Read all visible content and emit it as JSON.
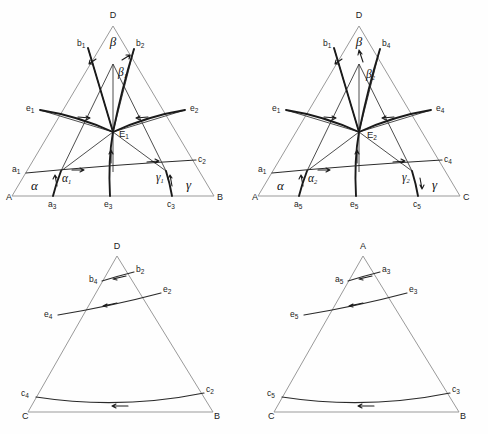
{
  "figure": {
    "title": "",
    "background": "#fefefe",
    "edge_color": "#9a9a9a",
    "curve_color": "#1a1a1a",
    "line_color": "#3a3a3a",
    "panels": [
      {
        "id": "top-left",
        "vertices": {
          "apex": "D",
          "left": "A",
          "right": "B"
        },
        "invariant_point": "E",
        "invariant_point_sub": "1",
        "greek": {
          "alpha": "α",
          "beta": "β",
          "gamma": "γ",
          "alpha_sub": "α",
          "alpha_sub_n": "1",
          "beta_sub": "β",
          "beta_sub_n": "1",
          "gamma_sub": "γ",
          "gamma_sub_n": "1"
        },
        "edge_labels": [
          {
            "name": "b1",
            "base": "b",
            "sub": "1"
          },
          {
            "name": "b2",
            "base": "b",
            "sub": "2"
          },
          {
            "name": "e1",
            "base": "e",
            "sub": "1"
          },
          {
            "name": "e2",
            "base": "e",
            "sub": "2"
          },
          {
            "name": "a1",
            "base": "a",
            "sub": "1"
          },
          {
            "name": "c2",
            "base": "c",
            "sub": "2"
          },
          {
            "name": "a3",
            "base": "a",
            "sub": "3"
          },
          {
            "name": "e3",
            "base": "e",
            "sub": "3"
          },
          {
            "name": "c3",
            "base": "c",
            "sub": "3"
          }
        ]
      },
      {
        "id": "top-right",
        "vertices": {
          "apex": "D",
          "left": "A",
          "right": "C"
        },
        "invariant_point": "E",
        "invariant_point_sub": "2",
        "greek": {
          "alpha": "α",
          "beta": "β",
          "gamma": "γ",
          "alpha_sub": "α",
          "alpha_sub_n": "2",
          "beta_sub": "β",
          "beta_sub_n": "2",
          "gamma_sub": "γ",
          "gamma_sub_n": "2"
        },
        "edge_labels": [
          {
            "name": "b1",
            "base": "b",
            "sub": "1"
          },
          {
            "name": "b4",
            "base": "b",
            "sub": "4"
          },
          {
            "name": "e1",
            "base": "e",
            "sub": "1"
          },
          {
            "name": "e4",
            "base": "e",
            "sub": "4"
          },
          {
            "name": "a1",
            "base": "a",
            "sub": "1"
          },
          {
            "name": "c4",
            "base": "c",
            "sub": "4"
          },
          {
            "name": "a5",
            "base": "a",
            "sub": "5"
          },
          {
            "name": "e5",
            "base": "e",
            "sub": "5"
          },
          {
            "name": "c5",
            "base": "c",
            "sub": "5"
          }
        ]
      },
      {
        "id": "bottom-left",
        "vertices": {
          "apex": "D",
          "left": "C",
          "right": "B"
        },
        "edge_labels": [
          {
            "name": "b4",
            "base": "b",
            "sub": "4"
          },
          {
            "name": "b2",
            "base": "b",
            "sub": "2"
          },
          {
            "name": "e4",
            "base": "e",
            "sub": "4"
          },
          {
            "name": "e2",
            "base": "e",
            "sub": "2"
          },
          {
            "name": "c4",
            "base": "c",
            "sub": "4"
          },
          {
            "name": "c2",
            "base": "c",
            "sub": "2"
          }
        ]
      },
      {
        "id": "bottom-right",
        "vertices": {
          "apex": "A",
          "left": "C",
          "right": "B"
        },
        "edge_labels": [
          {
            "name": "a5",
            "base": "a",
            "sub": "5"
          },
          {
            "name": "a3",
            "base": "a",
            "sub": "3"
          },
          {
            "name": "e5",
            "base": "e",
            "sub": "5"
          },
          {
            "name": "e3",
            "base": "e",
            "sub": "3"
          },
          {
            "name": "c5",
            "base": "c",
            "sub": "5"
          },
          {
            "name": "c3",
            "base": "c",
            "sub": "3"
          }
        ]
      }
    ]
  }
}
